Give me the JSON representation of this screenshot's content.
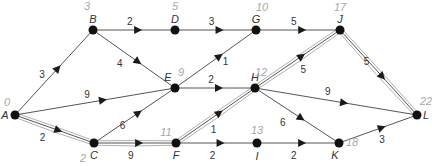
{
  "diagram": {
    "type": "activity-network",
    "nodes": [
      {
        "id": "A",
        "label": "A",
        "time": "0",
        "x": 15,
        "y": 115
      },
      {
        "id": "B",
        "label": "B",
        "time": "3",
        "x": 93,
        "y": 30
      },
      {
        "id": "C",
        "label": "C",
        "time": "2",
        "x": 94,
        "y": 143
      },
      {
        "id": "D",
        "label": "D",
        "time": "5",
        "x": 175,
        "y": 30
      },
      {
        "id": "E",
        "label": "E",
        "time": "9",
        "x": 175,
        "y": 88
      },
      {
        "id": "F",
        "label": "F",
        "time": "11",
        "x": 176,
        "y": 143
      },
      {
        "id": "G",
        "label": "G",
        "time": "10",
        "x": 256,
        "y": 30
      },
      {
        "id": "H",
        "label": "H",
        "time": "12",
        "x": 255,
        "y": 88
      },
      {
        "id": "I",
        "label": "I",
        "time": "13",
        "x": 257,
        "y": 143
      },
      {
        "id": "J",
        "label": "J",
        "time": "17",
        "x": 340,
        "y": 30
      },
      {
        "id": "K",
        "label": "K",
        "time": "18",
        "x": 339,
        "y": 143
      },
      {
        "id": "L",
        "label": "L",
        "time": "22",
        "x": 417,
        "y": 115
      }
    ],
    "edges": [
      {
        "from": "A",
        "to": "B",
        "weight": "3",
        "critical": false
      },
      {
        "from": "A",
        "to": "E",
        "weight": "9",
        "critical": false
      },
      {
        "from": "A",
        "to": "C",
        "weight": "2",
        "critical": true
      },
      {
        "from": "B",
        "to": "D",
        "weight": "2",
        "critical": false
      },
      {
        "from": "B",
        "to": "E",
        "weight": "4",
        "critical": false
      },
      {
        "from": "C",
        "to": "E",
        "weight": "6",
        "critical": false
      },
      {
        "from": "C",
        "to": "F",
        "weight": "9",
        "critical": true
      },
      {
        "from": "D",
        "to": "G",
        "weight": "3",
        "critical": false
      },
      {
        "from": "E",
        "to": "G",
        "weight": "1",
        "critical": false
      },
      {
        "from": "E",
        "to": "H",
        "weight": "2",
        "critical": false
      },
      {
        "from": "F",
        "to": "H",
        "weight": "1",
        "critical": true
      },
      {
        "from": "F",
        "to": "I",
        "weight": "2",
        "critical": false
      },
      {
        "from": "G",
        "to": "J",
        "weight": "5",
        "critical": false
      },
      {
        "from": "H",
        "to": "J",
        "weight": "5",
        "critical": true
      },
      {
        "from": "H",
        "to": "L",
        "weight": "9",
        "critical": false
      },
      {
        "from": "H",
        "to": "K",
        "weight": "6",
        "critical": false
      },
      {
        "from": "I",
        "to": "K",
        "weight": "2",
        "critical": false
      },
      {
        "from": "J",
        "to": "L",
        "weight": "5",
        "critical": true
      },
      {
        "from": "K",
        "to": "L",
        "weight": "3",
        "critical": false
      }
    ],
    "critical_path": [
      "A",
      "C",
      "F",
      "H",
      "J",
      "L"
    ],
    "project_duration": "22"
  }
}
